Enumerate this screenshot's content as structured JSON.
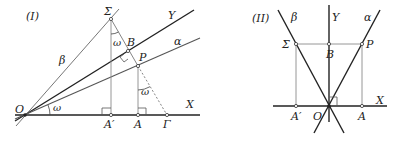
{
  "figure_I": {
    "title": "(I)",
    "points": {
      "O": "O",
      "Sigma": "Σ",
      "B": "B",
      "P": "P",
      "A_prime": "A′",
      "A": "A",
      "Gamma": "Γ"
    },
    "lines": {
      "X": "X",
      "Y": "Y",
      "alpha": "α",
      "beta": "β"
    },
    "angles": {
      "at_O": "ω",
      "at_Sigma": "ω",
      "at_P": "ω"
    }
  },
  "figure_II": {
    "title": "(II)",
    "points": {
      "O": "O",
      "Sigma": "Σ",
      "B": "B",
      "P": "P",
      "A_prime": "A′",
      "A": "A"
    },
    "lines": {
      "X": "X",
      "Y": "Y",
      "alpha": "α",
      "beta": "β"
    }
  },
  "colors": {
    "line_dark": "#222222",
    "line_light": "#8a8a8a"
  }
}
